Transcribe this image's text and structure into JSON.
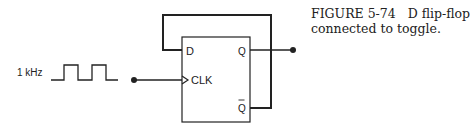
{
  "figure": {
    "caption_number": "FIGURE 5-74",
    "caption_text_line1": "D flip-flop",
    "caption_text_line2": "connected to toggle."
  },
  "diagram": {
    "clock_label": "1 kHz",
    "flipflop": {
      "input_d": "D",
      "input_clk": "CLK",
      "output_q": "Q",
      "output_qbar": "Q"
    },
    "colors": {
      "line": "#222222",
      "background": "#ffffff"
    }
  }
}
